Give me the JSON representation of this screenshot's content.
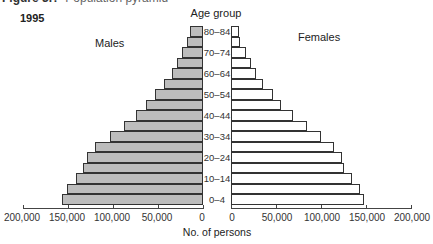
{
  "caption": {
    "label": "Figure 3.?",
    "rest": "Population pyramid"
  },
  "chart_data": {
    "type": "bar",
    "subtype": "population-pyramid",
    "title": "1995",
    "categories": [
      "80–84",
      "75–79",
      "70–74",
      "65–69",
      "60–64",
      "55–59",
      "50–54",
      "45–49",
      "40–44",
      "35–39",
      "30–34",
      "25–29",
      "20–24",
      "15–19",
      "10–14",
      "5–9",
      "0–4"
    ],
    "visible_age_labels": [
      "80–84",
      "70–74",
      "60–64",
      "50–54",
      "40–44",
      "30–34",
      "20–24",
      "10–14",
      "0–4"
    ],
    "series": [
      {
        "name": "Males",
        "color": "#bdbdbd",
        "values": [
          15000,
          18000,
          23000,
          29000,
          34000,
          43000,
          53000,
          63000,
          74000,
          88000,
          103000,
          120000,
          129000,
          133000,
          141000,
          151000,
          157000
        ]
      },
      {
        "name": "Females",
        "color": "#ffffff",
        "values": [
          9000,
          10000,
          17000,
          22000,
          28000,
          36000,
          47000,
          56000,
          69000,
          84000,
          100000,
          114000,
          123000,
          126000,
          134000,
          143000,
          148000
        ]
      }
    ],
    "category_axis_label": "Age group",
    "xlabel": "No. of persons",
    "male_ticks": [
      "200,000",
      "150,000",
      "100,000",
      "50,000",
      "0"
    ],
    "female_ticks": [
      "0",
      "50,000",
      "100,000",
      "150,000",
      "200,000"
    ],
    "xlim": [
      0,
      200000
    ],
    "grid": false,
    "legend": "inline labels: Males (left), Females (right)"
  },
  "labels": {
    "year": "1995",
    "age_group": "Age group",
    "males": "Males",
    "females": "Females",
    "xlabel": "No. of persons"
  }
}
